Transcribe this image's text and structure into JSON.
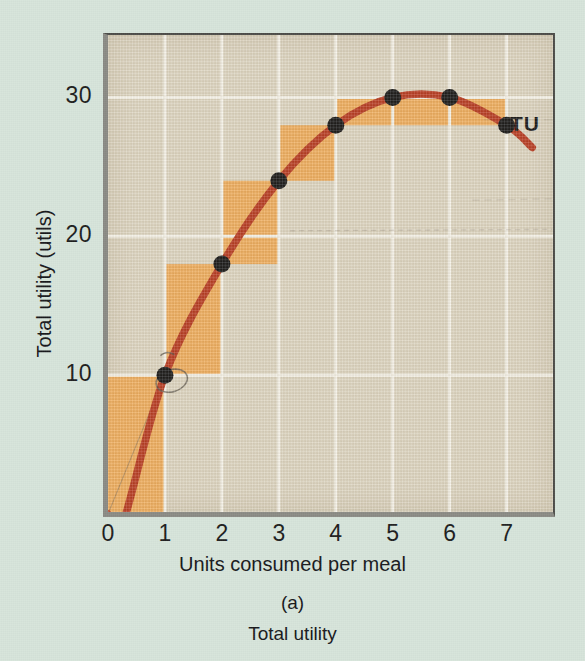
{
  "figure": {
    "panel_id": "(a)",
    "panel_caption": "Total utility",
    "series_label": "TU",
    "background_color": "#d6e4da",
    "plot_background_color": "#ded6c2",
    "bar_color": "#f0ad5c",
    "curve_color": "#b8391f",
    "gridline_color": "#f7f4ea",
    "point_color": "#141414"
  },
  "chart_data": {
    "type": "line",
    "title": "Total utility",
    "xlabel": "Units consumed per meal",
    "ylabel": "Total utility (utils)",
    "x": [
      0,
      1,
      2,
      3,
      4,
      5,
      6,
      7
    ],
    "values": [
      0,
      10,
      18,
      24,
      28,
      30,
      30,
      28
    ],
    "series": [
      {
        "name": "TU",
        "values": [
          0,
          10,
          18,
          24,
          28,
          30,
          30,
          28
        ]
      }
    ],
    "marginal_bars": [
      {
        "from_x": 0,
        "to_x": 1,
        "base": 0,
        "top": 10
      },
      {
        "from_x": 1,
        "to_x": 2,
        "base": 10,
        "top": 18
      },
      {
        "from_x": 2,
        "to_x": 3,
        "base": 18,
        "top": 24
      },
      {
        "from_x": 3,
        "to_x": 4,
        "base": 24,
        "top": 28
      },
      {
        "from_x": 4,
        "to_x": 5,
        "base": 28,
        "top": 30
      },
      {
        "from_x": 5,
        "to_x": 6,
        "base": 28,
        "top": 30
      },
      {
        "from_x": 6,
        "to_x": 7,
        "base": 28,
        "top": 30
      }
    ],
    "xticks": [
      "0",
      "1",
      "2",
      "3",
      "4",
      "5",
      "6",
      "7"
    ],
    "yticks": [
      "10",
      "20",
      "30"
    ],
    "ytick_values": [
      10,
      20,
      30
    ],
    "xlim": [
      0,
      7.85
    ],
    "ylim": [
      0,
      34.5
    ],
    "grid": true,
    "legend_position": "inline-right"
  }
}
